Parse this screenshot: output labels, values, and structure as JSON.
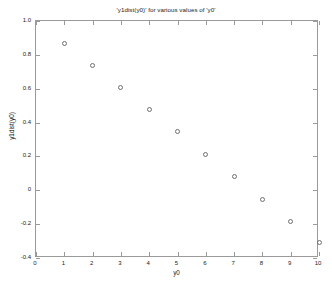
{
  "chart_data": {
    "type": "scatter",
    "title": "'y1dist(y0)' for various values of 'y0'",
    "xlabel": "y0",
    "ylabel": "y1dist(y0)",
    "x": [
      1,
      2,
      3,
      4,
      5,
      6,
      7,
      8,
      9,
      10
    ],
    "values": [
      0.866,
      0.739,
      0.607,
      0.476,
      0.348,
      0.212,
      0.079,
      -0.053,
      -0.183,
      -0.311
    ],
    "series": [
      {
        "name": "y1dist(y0)",
        "x": [
          1,
          2,
          3,
          4,
          5,
          6,
          7,
          8,
          9,
          10
        ],
        "values": [
          0.866,
          0.739,
          0.607,
          0.476,
          0.348,
          0.212,
          0.079,
          -0.053,
          -0.183,
          -0.311
        ]
      }
    ],
    "xlim": [
      0,
      10
    ],
    "ylim": [
      -0.4,
      1.0
    ],
    "xticks": [
      0,
      1,
      2,
      3,
      4,
      5,
      6,
      7,
      8,
      9,
      10
    ],
    "xticklabels": [
      "0",
      "1",
      "2",
      "3",
      "4",
      "5",
      "6",
      "7",
      "8",
      "9",
      "10"
    ],
    "yticks": [
      -0.4,
      -0.2,
      0,
      0.2,
      0.4,
      0.6,
      0.8,
      1.0
    ],
    "yticklabels": [
      "-0.4",
      "-0.2",
      "0",
      "0.2",
      "0.4",
      "0.6",
      "0.8",
      "1.0"
    ],
    "grid": false,
    "legend": false,
    "marker": "open-circle",
    "marker_color": "#6e6e6e",
    "axis_color": "#9a9a9a",
    "background": "#ffffff"
  }
}
